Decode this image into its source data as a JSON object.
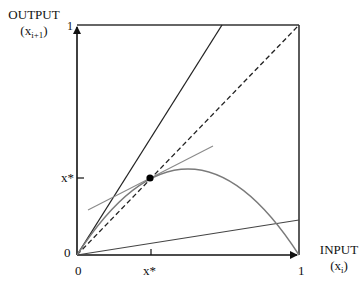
{
  "diagram": {
    "type": "cobweb-map-fixed-point",
    "y_axis": {
      "title": "OUTPUT",
      "var": "x",
      "var_sub": "i+1",
      "tick_top": "1",
      "tick_origin": "0",
      "tick_xstar": "x*"
    },
    "x_axis": {
      "title": "INPUT",
      "var": "x",
      "var_sub": "i",
      "tick_right": "1",
      "tick_origin": "0",
      "tick_xstar": "x*"
    },
    "elements": [
      {
        "name": "identity-line",
        "style": "dashed",
        "from": [
          0,
          0
        ],
        "to": [
          1,
          1
        ]
      },
      {
        "name": "steep-line",
        "style": "solid",
        "slope": 1.5
      },
      {
        "name": "shallow-line",
        "style": "solid",
        "slope": 0.152
      },
      {
        "name": "map-curve",
        "style": "grey",
        "form": "r*x*(1-x)",
        "r": 1.5,
        "peak": 0.375
      },
      {
        "name": "tangent-line",
        "style": "grey",
        "at": "x*",
        "slope": 0.5
      },
      {
        "name": "fixed-point",
        "x": 0.333,
        "y": 0.333
      }
    ],
    "colors": {
      "axis": "#111111",
      "curve": "#7a7a7a",
      "tangent": "#8a8a8a",
      "point": "#000000"
    }
  }
}
